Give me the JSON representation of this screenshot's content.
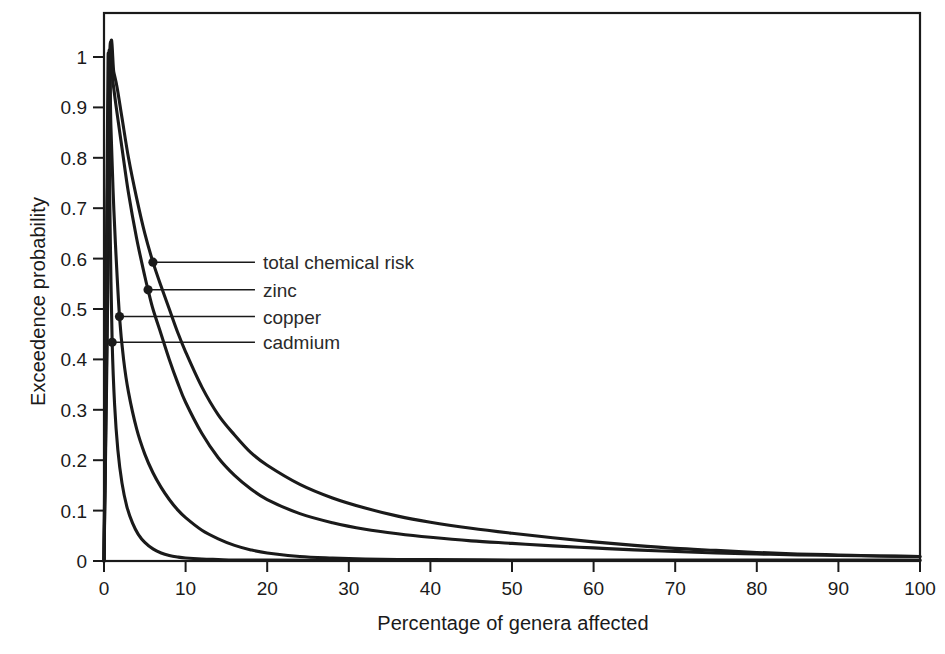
{
  "figure": {
    "background_color": "#ffffff",
    "line_color": "#1a1a1a",
    "frame_color": "#1a1a1a"
  },
  "chart_data": {
    "type": "line",
    "title": "",
    "subtitle": "",
    "xlabel": "Percentage of genera affected",
    "ylabel": "Exceedence probability",
    "xlim": [
      0,
      100
    ],
    "ylim": [
      0,
      1
    ],
    "xticks": [
      0,
      10,
      20,
      30,
      40,
      50,
      60,
      70,
      80,
      90,
      100
    ],
    "xticklabels": [
      "0",
      "10",
      "20",
      "30",
      "40",
      "50",
      "60",
      "70",
      "80",
      "90",
      "100"
    ],
    "yticks": [
      0,
      0.1,
      0.2,
      0.3,
      0.4,
      0.5,
      0.6,
      0.7,
      0.8,
      0.9,
      1
    ],
    "yticklabels": [
      "0",
      "0.1",
      "0.2",
      "0.3",
      "0.4",
      "0.5",
      "0.6",
      "0.7",
      "0.8",
      "0.9",
      "1"
    ],
    "grid": false,
    "legend": "inline-leader-labels",
    "series": [
      {
        "name": "total chemical risk",
        "label": "total chemical risk",
        "marker_point": [
          6.0,
          0.593
        ],
        "label_anchor": [
          18.5,
          0.593
        ],
        "points": [
          [
            0.0,
            0.0
          ],
          [
            0.4,
            0.45
          ],
          [
            0.8,
            1.0
          ],
          [
            1.2,
            0.97
          ],
          [
            1.6,
            0.94
          ],
          [
            2.2,
            0.88
          ],
          [
            3.0,
            0.8
          ],
          [
            4.0,
            0.72
          ],
          [
            5.0,
            0.65
          ],
          [
            6.0,
            0.593
          ],
          [
            7.0,
            0.545
          ],
          [
            8.0,
            0.5
          ],
          [
            9.0,
            0.455
          ],
          [
            10.0,
            0.415
          ],
          [
            12.0,
            0.345
          ],
          [
            14.0,
            0.29
          ],
          [
            16.0,
            0.25
          ],
          [
            18.0,
            0.215
          ],
          [
            20.0,
            0.19
          ],
          [
            24.0,
            0.152
          ],
          [
            28.0,
            0.125
          ],
          [
            32.0,
            0.105
          ],
          [
            36.0,
            0.089
          ],
          [
            40.0,
            0.077
          ],
          [
            45.0,
            0.065
          ],
          [
            50.0,
            0.055
          ],
          [
            55.0,
            0.046
          ],
          [
            60.0,
            0.038
          ],
          [
            65.0,
            0.031
          ],
          [
            70.0,
            0.025
          ],
          [
            75.0,
            0.021
          ],
          [
            80.0,
            0.017
          ],
          [
            85.0,
            0.014
          ],
          [
            90.0,
            0.012
          ],
          [
            95.0,
            0.01
          ],
          [
            100.0,
            0.009
          ]
        ]
      },
      {
        "name": "zinc",
        "label": "zinc",
        "marker_point": [
          5.4,
          0.538
        ],
        "label_anchor": [
          18.5,
          0.538
        ],
        "points": [
          [
            0.0,
            0.0
          ],
          [
            0.35,
            0.45
          ],
          [
            0.7,
            1.0
          ],
          [
            1.1,
            0.95
          ],
          [
            1.5,
            0.9
          ],
          [
            2.2,
            0.82
          ],
          [
            3.0,
            0.73
          ],
          [
            4.0,
            0.64
          ],
          [
            5.0,
            0.565
          ],
          [
            5.4,
            0.538
          ],
          [
            6.0,
            0.5
          ],
          [
            7.0,
            0.45
          ],
          [
            8.0,
            0.4
          ],
          [
            9.0,
            0.355
          ],
          [
            10.0,
            0.315
          ],
          [
            12.0,
            0.253
          ],
          [
            14.0,
            0.205
          ],
          [
            16.0,
            0.17
          ],
          [
            18.0,
            0.143
          ],
          [
            20.0,
            0.122
          ],
          [
            24.0,
            0.094
          ],
          [
            28.0,
            0.076
          ],
          [
            32.0,
            0.063
          ],
          [
            36.0,
            0.054
          ],
          [
            40.0,
            0.047
          ],
          [
            45.0,
            0.04
          ],
          [
            50.0,
            0.035
          ],
          [
            55.0,
            0.03
          ],
          [
            60.0,
            0.026
          ],
          [
            65.0,
            0.022
          ],
          [
            70.0,
            0.019
          ],
          [
            75.0,
            0.016
          ],
          [
            80.0,
            0.014
          ],
          [
            85.0,
            0.012
          ],
          [
            90.0,
            0.011
          ],
          [
            95.0,
            0.01
          ],
          [
            100.0,
            0.009
          ]
        ]
      },
      {
        "name": "copper",
        "label": "copper",
        "marker_point": [
          1.9,
          0.485
        ],
        "label_anchor": [
          18.5,
          0.485
        ],
        "points": [
          [
            0.0,
            0.0
          ],
          [
            0.3,
            0.5
          ],
          [
            0.6,
            1.0
          ],
          [
            0.85,
            0.86
          ],
          [
            1.1,
            0.74
          ],
          [
            1.4,
            0.63
          ],
          [
            1.9,
            0.485
          ],
          [
            2.4,
            0.4
          ],
          [
            3.0,
            0.335
          ],
          [
            4.0,
            0.262
          ],
          [
            5.0,
            0.212
          ],
          [
            6.0,
            0.175
          ],
          [
            7.0,
            0.146
          ],
          [
            8.0,
            0.122
          ],
          [
            9.0,
            0.102
          ],
          [
            10.0,
            0.086
          ],
          [
            12.0,
            0.061
          ],
          [
            14.0,
            0.044
          ],
          [
            16.0,
            0.031
          ],
          [
            18.0,
            0.022
          ],
          [
            20.0,
            0.016
          ],
          [
            24.0,
            0.009
          ],
          [
            28.0,
            0.006
          ],
          [
            32.0,
            0.004
          ],
          [
            36.0,
            0.003
          ],
          [
            40.0,
            0.003
          ],
          [
            50.0,
            0.002
          ],
          [
            60.0,
            0.002
          ],
          [
            70.0,
            0.002
          ],
          [
            80.0,
            0.002
          ],
          [
            90.0,
            0.002
          ],
          [
            100.0,
            0.002
          ]
        ]
      },
      {
        "name": "cadmium",
        "label": "cadmium",
        "marker_point": [
          1.0,
          0.434
        ],
        "label_anchor": [
          18.5,
          0.434
        ],
        "points": [
          [
            0.0,
            0.0
          ],
          [
            0.25,
            0.5
          ],
          [
            0.5,
            1.0
          ],
          [
            0.65,
            0.79
          ],
          [
            0.8,
            0.61
          ],
          [
            1.0,
            0.434
          ],
          [
            1.3,
            0.31
          ],
          [
            1.7,
            0.22
          ],
          [
            2.2,
            0.155
          ],
          [
            2.8,
            0.108
          ],
          [
            3.5,
            0.075
          ],
          [
            4.2,
            0.053
          ],
          [
            5.0,
            0.037
          ],
          [
            6.0,
            0.024
          ],
          [
            7.0,
            0.016
          ],
          [
            8.0,
            0.011
          ],
          [
            9.0,
            0.008
          ],
          [
            10.0,
            0.006
          ],
          [
            12.0,
            0.004
          ],
          [
            14.0,
            0.003
          ],
          [
            16.0,
            0.002
          ],
          [
            20.0,
            0.002
          ],
          [
            30.0,
            0.001
          ],
          [
            40.0,
            0.001
          ],
          [
            50.0,
            0.001
          ],
          [
            60.0,
            0.001
          ],
          [
            70.0,
            0.001
          ],
          [
            80.0,
            0.001
          ],
          [
            90.0,
            0.001
          ],
          [
            100.0,
            0.001
          ]
        ]
      }
    ]
  }
}
